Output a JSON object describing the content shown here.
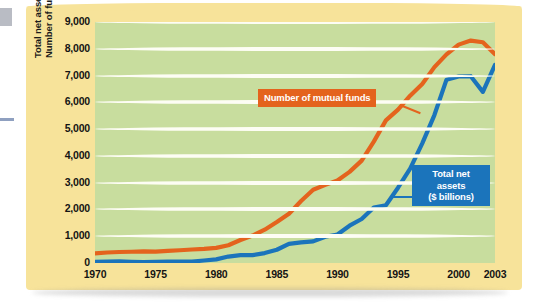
{
  "chart_data": {
    "type": "line",
    "title": "",
    "xlabel": "",
    "ylabel": "Total net assets ($ billions)\nNumber of funds",
    "ylabel_line1": "Total net assets ($ billions)",
    "ylabel_line2": "Number of funds",
    "xlim": [
      1970,
      2003
    ],
    "ylim": [
      0,
      9000
    ],
    "grid": true,
    "legend_position": "inline-callouts",
    "xticks": [
      "1970",
      "1975",
      "1980",
      "1985",
      "1990",
      "1995",
      "2000",
      "2003"
    ],
    "xtick_values": [
      1970,
      1975,
      1980,
      1985,
      1990,
      1995,
      2000,
      2003
    ],
    "yticks": [
      "0",
      "1,000",
      "2,000",
      "3,000",
      "4,000",
      "5,000",
      "6,000",
      "7,000",
      "8,000",
      "9,000"
    ],
    "ytick_values": [
      0,
      1000,
      2000,
      3000,
      4000,
      5000,
      6000,
      7000,
      8000,
      9000
    ],
    "x": [
      1970,
      1971,
      1972,
      1973,
      1974,
      1975,
      1976,
      1977,
      1978,
      1979,
      1980,
      1981,
      1982,
      1983,
      1984,
      1985,
      1986,
      1987,
      1988,
      1989,
      1990,
      1991,
      1992,
      1993,
      1994,
      1995,
      1996,
      1997,
      1998,
      1999,
      2000,
      2001,
      2002,
      2003
    ],
    "series": [
      {
        "name": "Number of mutual funds",
        "color": "#e4631d",
        "values": [
          361,
          392,
          410,
          421,
          431,
          426,
          452,
          477,
          505,
          526,
          564,
          665,
          857,
          1026,
          1243,
          1528,
          1835,
          2317,
          2737,
          2917,
          3079,
          3403,
          3824,
          4534,
          5325,
          5725,
          6248,
          6684,
          7314,
          7791,
          8155,
          8305,
          8244,
          7800
        ]
      },
      {
        "name": "Total net assets ($ billions)",
        "color": "#1b74bb",
        "values": [
          47,
          55,
          59,
          46,
          35,
          45,
          51,
          48,
          55,
          94,
          134,
          241,
          296,
          292,
          370,
          495,
          716,
          769,
          809,
          982,
          1065,
          1393,
          1642,
          2070,
          2155,
          2811,
          3526,
          4468,
          5525,
          6846,
          6965,
          6975,
          6390,
          7400
        ]
      }
    ],
    "callouts": [
      {
        "id": "orange-callout",
        "text": "Number of mutual funds",
        "series": "Number of mutual funds",
        "bg": "#e4631d",
        "fg": "#ffffff"
      },
      {
        "id": "blue-callout",
        "lines": [
          "Total net",
          "assets",
          "($ billions)"
        ],
        "text": "Total net assets ($ billions)",
        "series": "Total net assets ($ billions)",
        "bg": "#1b74bb",
        "fg": "#ffffff"
      }
    ],
    "colors": {
      "card_background": "#f7e39a",
      "plot_background": "#c8dd9e",
      "gridline": "#fdfdf4",
      "orange_series": "#e4631d",
      "blue_series": "#1b74bb",
      "text": "#141414"
    }
  }
}
